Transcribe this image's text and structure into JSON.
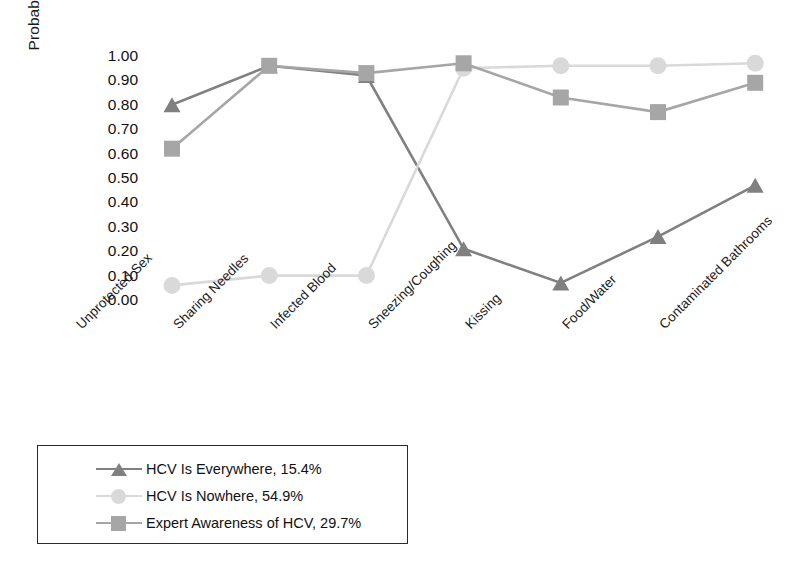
{
  "chart_data": {
    "type": "line",
    "title": "",
    "xlabel": "",
    "ylabel": "Probability of a Correct Response",
    "ylim": [
      0.0,
      1.0
    ],
    "ytick_labels": [
      "1.00",
      "0.90",
      "0.80",
      "0.70",
      "0.60",
      "0.50",
      "0.40",
      "0.30",
      "0.20",
      "0.10",
      "0.00"
    ],
    "ytick_values": [
      1.0,
      0.9,
      0.8,
      0.7,
      0.6,
      0.5,
      0.4,
      0.3,
      0.2,
      0.1,
      0.0
    ],
    "grid": false,
    "legend_position": "below-left",
    "categories": [
      "Unprotected Sex",
      "Sharing Needles",
      "Infected Blood",
      "Sneezing/Coughing",
      "Kissing",
      "Food/Water",
      "Contaminated Bathrooms"
    ],
    "series": [
      {
        "name": "HCV Is Everywhere, 15.4%",
        "marker": "triangle",
        "color": "#808080",
        "values": [
          0.8,
          0.96,
          0.92,
          0.21,
          0.07,
          0.26,
          0.47
        ]
      },
      {
        "name": "HCV Is Nowhere, 54.9%",
        "marker": "circle",
        "color": "#d9d9d9",
        "values": [
          0.06,
          0.1,
          0.1,
          0.95,
          0.96,
          0.96,
          0.97
        ]
      },
      {
        "name": "Expert Awareness of HCV, 29.7%",
        "marker": "square",
        "color": "#a6a6a6",
        "values": [
          0.62,
          0.96,
          0.93,
          0.97,
          0.83,
          0.77,
          0.89
        ]
      }
    ]
  },
  "legend": {
    "entries": [
      "HCV Is Everywhere, 15.4%",
      "HCV Is Nowhere, 54.9%",
      "Expert Awareness of HCV, 29.7%"
    ]
  }
}
